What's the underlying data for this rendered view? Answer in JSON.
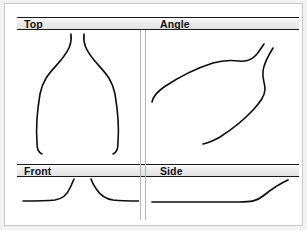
{
  "panel": {
    "title": "Four-View Object Sketch",
    "background_color": "#f2f2f2",
    "plate_color": "#ffffff",
    "frame_color": "#c8c8c8",
    "rule_color": "#1a1a1a",
    "band_color": "#e9e9e9",
    "divider_color": "#b4b4b4",
    "stroke_color": "#0d0d0d"
  },
  "bands": {
    "top": {
      "left_label": "Top",
      "right_label": "Angle"
    },
    "bottom": {
      "left_label": "Front",
      "right_label": "Side"
    }
  },
  "views": [
    {
      "key": "top",
      "label": "Top",
      "description": "Symmetric bottle outline: narrow neck flaring into a wide body",
      "stroke_count": 2
    },
    {
      "key": "angle",
      "label": "Angle",
      "description": "Oblique perspective: an upper sweeping contour and a lower hooked contour",
      "stroke_count": 2
    },
    {
      "key": "front",
      "label": "Front",
      "description": "Two mirrored base curves, flat then turning upward toward the centre",
      "stroke_count": 2
    },
    {
      "key": "side",
      "label": "Side",
      "description": "Single profile line, flat across then rising at the right end",
      "stroke_count": 1
    }
  ],
  "sketch_paths": {
    "top_left_curve": "M 54 4 C 55 14, 52 20, 44 30 C 34 42, 26 48, 23 64 C 20 82, 19 100, 20 112 C 20 119, 21 122, 25 124",
    "top_right_curve": "M 67 4 C 66 14, 69 20, 77 30 C 87 42, 95 48, 98 64 C 101 82, 102 100, 101 112 C 101 119, 100 122, 96 124",
    "angle_upper_curve": "M 5 72 C 6 66, 10 62, 17 57 C 32 47, 50 38, 66 33 C 76 30, 84 30, 92 31 C 100 32, 105 30, 110 24 C 113 20, 115 17, 117 14",
    "angle_lower_curve": "M 126 18 C 121 26, 117 33, 116 41 C 115 49, 118 53, 118 59 C 118 66, 113 72, 107 79 C 96 91, 84 100, 73 107 C 66 111, 61 113, 56 114",
    "front_left_curve": "M 6 24 C 16 24, 28 24, 38 23 C 45 22, 50 18, 53 11 C 55 7, 56 4, 57 2",
    "front_right_curve": "M 74 2 C 75 5, 77 9, 80 13 C 84 19, 89 22, 96 23 C 106 24, 116 24, 124 24",
    "side_profile_line": "M 5 25 C 25 25, 60 25, 92 25 C 104 25, 110 24, 116 19 C 126 11, 134 6, 141 3"
  }
}
